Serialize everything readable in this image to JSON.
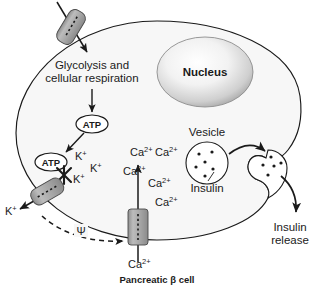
{
  "figure": {
    "caption": "Pancreatic β cell"
  },
  "labels": {
    "glycolysis_line1": "Glycolysis and",
    "glycolysis_line2": "cellular respiration",
    "nucleus": "Nucleus",
    "atp_upper": "ATP",
    "atp_lower": "ATP",
    "vesicle": "Vesicle",
    "insulin": "Insulin",
    "insulin_release_line1": "Insulin",
    "insulin_release_line2": "release",
    "membrane_potential": "Ψ"
  },
  "ions": {
    "potassium_inside": [
      "K+",
      "K+",
      "K+"
    ],
    "potassium_outside": "K+",
    "calcium_cytosol": [
      "Ca2+",
      "Ca2+",
      "Ca2+",
      "Ca2+",
      "Ca2+"
    ],
    "calcium_outside": "Ca2+",
    "potassium_symbol": "K",
    "potassium_charge": "+",
    "calcium_symbol": "Ca",
    "calcium_charge": "2+"
  },
  "structures": {
    "glucose_transporter": "glucose-transporter",
    "potassium_channel": "potassium-channel",
    "calcium_channel": "calcium-channel",
    "inhibition_mark": "×",
    "vesicle_free": "vesicle-free",
    "vesicle_fusing": "vesicle-fusing"
  },
  "colors": {
    "outline": "#1a1a1a",
    "cytoplasm": "#f7f7f7",
    "nucleus_light": "#fdfdfd",
    "nucleus_dark": "#9a9a9a",
    "channel_fill": "#a8a8a8",
    "background": "#ffffff",
    "text": "#1a1a1a"
  }
}
